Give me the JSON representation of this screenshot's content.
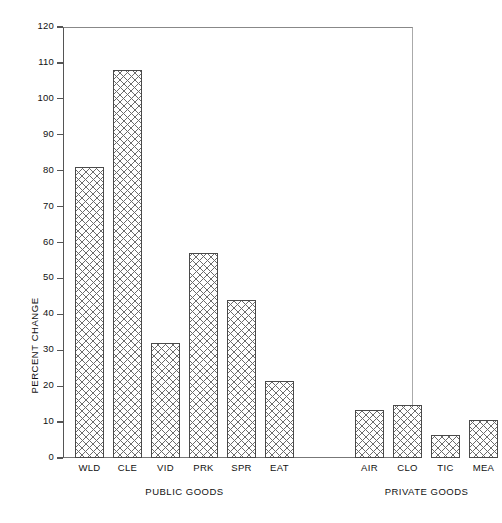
{
  "chart_data": {
    "type": "bar",
    "title": "",
    "xlabel": "",
    "ylabel": "PERCENT CHANGE",
    "ylim": [
      0,
      120
    ],
    "ytick_step": 10,
    "yticks": [
      0,
      10,
      20,
      30,
      40,
      50,
      60,
      70,
      80,
      90,
      100,
      110,
      120
    ],
    "grid": false,
    "legend": null,
    "categories": [
      "WLD",
      "CLE",
      "VID",
      "PRK",
      "SPR",
      "EAT",
      "AIR",
      "CLO",
      "TIC",
      "MEA"
    ],
    "values": [
      81,
      108,
      32,
      57,
      44,
      21.5,
      13.5,
      14.8,
      6.3,
      10.5
    ],
    "groups": [
      {
        "label": "PUBLIC GOODS",
        "categories": [
          "WLD",
          "CLE",
          "VID",
          "PRK",
          "SPR",
          "EAT"
        ],
        "values": [
          81,
          108,
          32,
          57,
          44,
          21.5
        ]
      },
      {
        "label": "PRIVATE GOODS",
        "categories": [
          "AIR",
          "CLO",
          "TIC",
          "MEA"
        ],
        "values": [
          13.5,
          14.8,
          6.3,
          10.5
        ]
      }
    ],
    "bar_fill": "crosshatch",
    "bar_edge_color": "#4a4a4a",
    "bar_hatch_color": "#6b6b6b",
    "axis_color": "#555555"
  }
}
